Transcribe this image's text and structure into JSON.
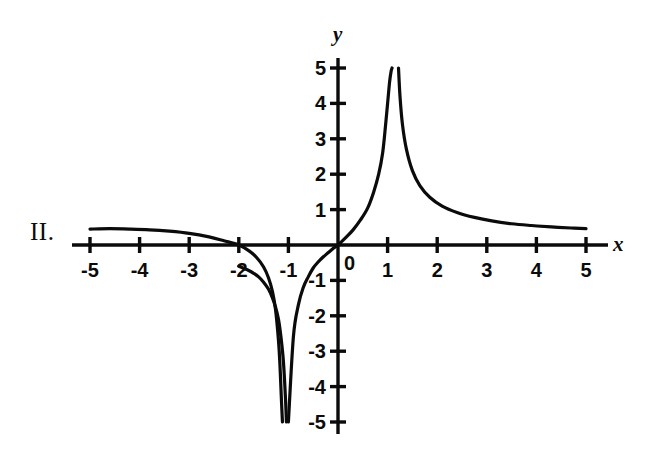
{
  "figure": {
    "label": "II.",
    "background_color": "#ffffff",
    "ink_color": "#0b0b0b"
  },
  "chart_data": {
    "type": "line",
    "title": "",
    "subtitle": "",
    "xlabel": "x",
    "ylabel": "y",
    "origin_label": "0",
    "xlim": [
      -5.6,
      5.6
    ],
    "ylim": [
      -5.6,
      5.6
    ],
    "xticks": [
      -5,
      -4,
      -3,
      -2,
      -1,
      1,
      2,
      3,
      4,
      5
    ],
    "yticks": [
      5,
      4,
      3,
      2,
      1,
      -1,
      -2,
      -3,
      -4,
      -5
    ],
    "xtick_labels": [
      "-5",
      "-4",
      "-3",
      "-2",
      "-1",
      "1",
      "2",
      "3",
      "4",
      "5"
    ],
    "ytick_labels": [
      "5",
      "4",
      "3",
      "2",
      "1",
      "-1",
      "-2",
      "-3",
      "-4",
      "-5"
    ],
    "grid": false,
    "legend": null,
    "annotations": [],
    "asymptotes": {
      "vertical": [
        -1.08,
        1.15
      ],
      "horizontal": [
        0
      ]
    },
    "x_intercepts": [
      -2,
      0
    ],
    "y_intercepts": [
      0
    ],
    "series": [
      {
        "name": "branch-left-tail",
        "comment": "left-most branch: from x=-5 down through x-intercept at -2 to -infinity near x=-1.08",
        "x": [
          -5.0,
          -4.6,
          -4.2,
          -3.8,
          -3.4,
          -3.0,
          -2.6,
          -2.3,
          -2.0,
          -1.8,
          -1.65,
          -1.5,
          -1.4,
          -1.32,
          -1.26,
          -1.2,
          -1.17,
          -1.14,
          -1.12
        ],
        "y": [
          0.45,
          0.46,
          0.45,
          0.43,
          0.39,
          0.33,
          0.23,
          0.12,
          0.0,
          -0.16,
          -0.34,
          -0.62,
          -0.93,
          -1.32,
          -1.82,
          -2.7,
          -3.4,
          -4.4,
          -5.0
        ]
      },
      {
        "name": "branch-middle",
        "comment": "middle branch: from -infinity near x=-1.04 rising through the origin to +infinity near x=1.12",
        "x": [
          -1.04,
          -1.06,
          -1.1,
          -1.15,
          -1.2,
          -1.26,
          -1.32,
          -1.4,
          -1.5,
          -1.6,
          -1.7,
          -1.8,
          -1.9,
          -2.0
        ],
        "y": [
          -5.0,
          -4.3,
          -3.3,
          -2.6,
          -2.1,
          -1.75,
          -1.5,
          -1.25,
          -1.05,
          -0.9,
          -0.8,
          -0.72,
          -0.66,
          -0.6
        ],
        "x2": [
          -1.0,
          -0.9,
          -0.8,
          -0.7,
          -0.6,
          -0.5,
          -0.4,
          -0.3,
          -0.2,
          -0.1,
          0.0,
          0.15,
          0.3,
          0.45,
          0.6,
          0.72,
          0.82,
          0.9,
          0.96,
          1.0,
          1.04,
          1.07,
          1.09
        ],
        "y2": [
          -5.0,
          -2.6,
          -1.7,
          -1.2,
          -0.9,
          -0.65,
          -0.48,
          -0.34,
          -0.22,
          -0.1,
          0.0,
          0.2,
          0.42,
          0.7,
          1.05,
          1.5,
          2.0,
          2.6,
          3.4,
          4.0,
          4.6,
          4.9,
          5.0
        ]
      },
      {
        "name": "branch-right-tail",
        "comment": "right branch: from +infinity near x=1.2 decaying toward y=0.45 at x=5",
        "x": [
          1.22,
          1.25,
          1.3,
          1.38,
          1.5,
          1.65,
          1.85,
          2.1,
          2.4,
          2.75,
          3.1,
          3.5,
          3.9,
          4.3,
          4.7,
          5.0
        ],
        "y": [
          5.0,
          4.2,
          3.4,
          2.7,
          2.1,
          1.68,
          1.35,
          1.1,
          0.92,
          0.78,
          0.68,
          0.6,
          0.55,
          0.51,
          0.48,
          0.46
        ]
      }
    ]
  }
}
